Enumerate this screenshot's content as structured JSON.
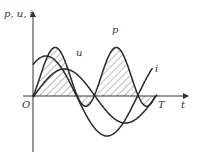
{
  "diagram": {
    "y_axis_label": "p, u, i",
    "x_axis_label": "t",
    "origin_label": "O",
    "period_label": "T",
    "curves": [
      {
        "name": "u",
        "label": "u"
      },
      {
        "name": "i",
        "label": "i"
      },
      {
        "name": "p",
        "label": "p"
      }
    ],
    "colors": {
      "line": "#2a2a2a",
      "hatch": "#555555",
      "background": "#ffffff"
    }
  }
}
